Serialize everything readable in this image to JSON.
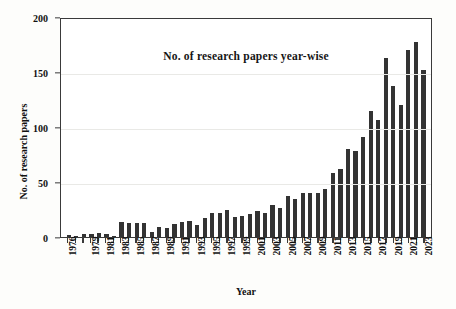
{
  "chart_data": {
    "type": "bar",
    "title": "No. of research papers year-wise",
    "xlabel": "Year",
    "ylabel": "No. of research papers",
    "ylim": [
      0,
      200
    ],
    "yticks": [
      0,
      50,
      100,
      150,
      200
    ],
    "grid": true,
    "legend": null,
    "bar_color": "#333333",
    "categories": [
      "1976",
      "1977",
      "1978",
      "1979",
      "1980",
      "1981",
      "1982",
      "1983",
      "1984",
      "1985",
      "1986",
      "1987",
      "1988",
      "1989",
      "1990",
      "1991",
      "1992",
      "1993",
      "1994",
      "1995",
      "1996",
      "1997",
      "1998",
      "1999",
      "2000",
      "2001",
      "2002",
      "2003",
      "2004",
      "2005",
      "2006",
      "2007",
      "2008",
      "2009",
      "2010",
      "2011",
      "2012",
      "2013",
      "2014",
      "2015",
      "2016",
      "2017",
      "2018",
      "2019",
      "2020",
      "2021",
      "2022",
      "2023"
    ],
    "values": [
      2,
      1,
      3,
      3,
      4,
      3,
      1,
      14,
      13,
      13,
      13,
      5,
      9,
      8,
      12,
      14,
      15,
      11,
      17,
      22,
      22,
      25,
      18,
      19,
      21,
      24,
      22,
      29,
      26,
      37,
      35,
      40,
      40,
      40,
      44,
      58,
      62,
      80,
      78,
      91,
      115,
      106,
      163,
      137,
      120,
      170,
      177,
      152
    ],
    "tick_label_years": [
      "1976",
      "1979",
      "1981",
      "1983",
      "1985",
      "1987",
      "1989",
      "1991",
      "1993",
      "1995",
      "1997",
      "1999",
      "2001",
      "2003",
      "2005",
      "2007",
      "2009",
      "2011",
      "2013",
      "2015",
      "2017",
      "2019",
      "2021",
      "2023"
    ]
  }
}
